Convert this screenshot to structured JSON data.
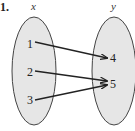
{
  "problem_label": "1.",
  "domain_set": {
    "title": "x",
    "elements": [
      "1",
      "2",
      "3"
    ]
  },
  "range_set": {
    "title": "y",
    "elements": [
      "4",
      "5"
    ]
  },
  "mapping": [
    {
      "from": "1",
      "to": "4"
    },
    {
      "from": "2",
      "to": "5"
    },
    {
      "from": "3",
      "to": "5"
    }
  ],
  "colors": {
    "ellipse_fill": "#e6e6e6",
    "stroke": "#333333"
  }
}
